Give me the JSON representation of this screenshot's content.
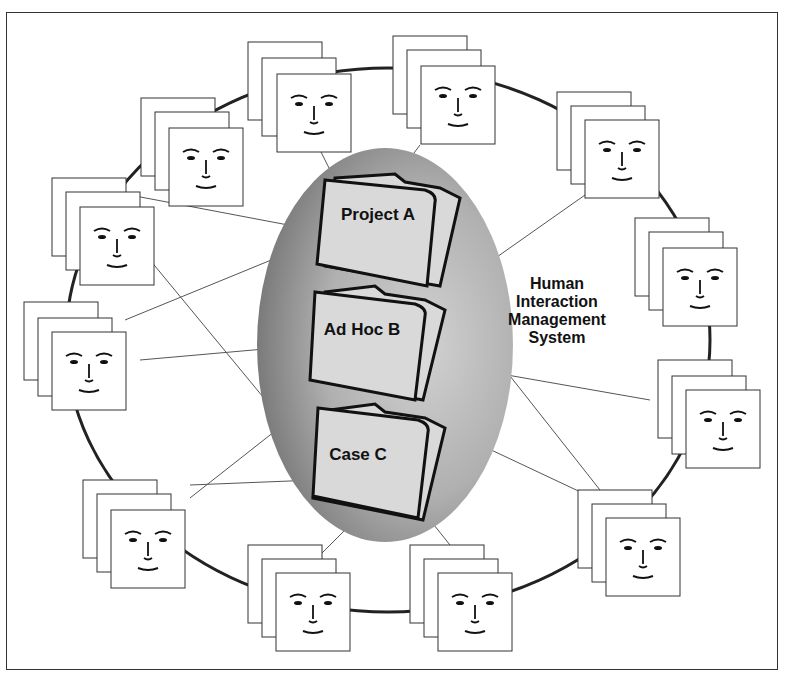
{
  "diagram": {
    "system_label": [
      "Human",
      "Interaction",
      "Management",
      "System"
    ],
    "folders": [
      {
        "label": "Project A"
      },
      {
        "label": "Ad Hoc B"
      },
      {
        "label": "Case C"
      }
    ],
    "colors": {
      "ellipse_dark": "#7a7a7a",
      "ellipse_light": "#c8c8c8",
      "folder_fill": "#d9d9d9",
      "ring": "#222222",
      "line": "#555555"
    },
    "participant_stacks": 12
  }
}
